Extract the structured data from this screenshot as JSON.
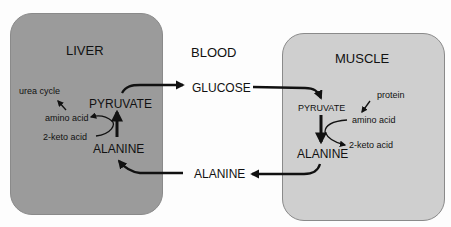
{
  "diagram": {
    "compartments": {
      "liver": {
        "title": "LIVER",
        "color": "#9b9b9b",
        "nodes": {
          "pyruvate": "PYRUVATE",
          "alanine": "ALANINE",
          "amino_acid": "amino acid",
          "keto_acid": "2-keto acid",
          "urea_cycle": "urea cycle"
        }
      },
      "blood": {
        "title": "BLOOD",
        "nodes": {
          "glucose": "GLUCOSE",
          "alanine": "ALANINE"
        }
      },
      "muscle": {
        "title": "MUSCLE",
        "color": "#cfcfcf",
        "nodes": {
          "pyruvate": "PYRUVATE",
          "alanine": "ALANINE",
          "protein": "protein",
          "amino_acid": "amino acid",
          "keto_acid": "2-keto acid"
        }
      }
    },
    "edges": [
      {
        "from": "liver.alanine",
        "to": "liver.pyruvate"
      },
      {
        "from": "liver.keto_acid",
        "to": "liver.amino_acid"
      },
      {
        "from": "liver.amino_acid",
        "to": "liver.urea_cycle"
      },
      {
        "from": "liver.pyruvate",
        "to": "blood.glucose"
      },
      {
        "from": "blood.glucose",
        "to": "muscle.pyruvate"
      },
      {
        "from": "muscle.pyruvate",
        "to": "muscle.alanine"
      },
      {
        "from": "muscle.amino_acid",
        "to": "muscle.keto_acid"
      },
      {
        "from": "muscle.protein",
        "to": "muscle.amino_acid"
      },
      {
        "from": "muscle.alanine",
        "to": "blood.alanine"
      },
      {
        "from": "blood.alanine",
        "to": "liver.alanine"
      }
    ]
  }
}
